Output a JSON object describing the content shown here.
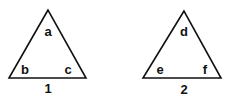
{
  "diagram": {
    "stroke_color": "#111111",
    "triangles": [
      {
        "id": "1",
        "label": "1",
        "angles": {
          "top": "a",
          "bottom_left": "b",
          "bottom_right": "c"
        },
        "vertices": {
          "top": [
            48,
            10
          ],
          "bottom_left": [
            9,
            78
          ],
          "bottom_right": [
            86,
            78
          ]
        }
      },
      {
        "id": "2",
        "label": "2",
        "angles": {
          "top": "d",
          "bottom_left": "e",
          "bottom_right": "f"
        },
        "vertices": {
          "top": [
            184,
            11
          ],
          "bottom_left": [
            143,
            78
          ],
          "bottom_right": [
            221,
            78
          ]
        }
      }
    ]
  }
}
